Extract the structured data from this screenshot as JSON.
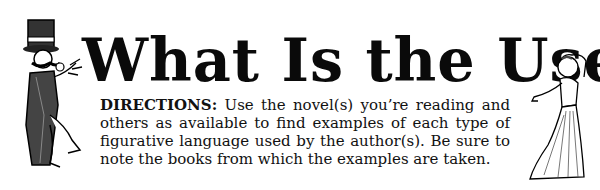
{
  "header": {
    "title": "What Is the Use?"
  },
  "directions": {
    "label": "DIRECTIONS:",
    "text": " Use the novel(s) you’re reading and others as available to find examples of each type of figurative language used by the author(s). Be sure to note the books from which the examples are taken."
  },
  "illustrations": {
    "left": "gentleman-in-top-hat-illustration",
    "right": "woman-in-long-dress-illustration"
  }
}
